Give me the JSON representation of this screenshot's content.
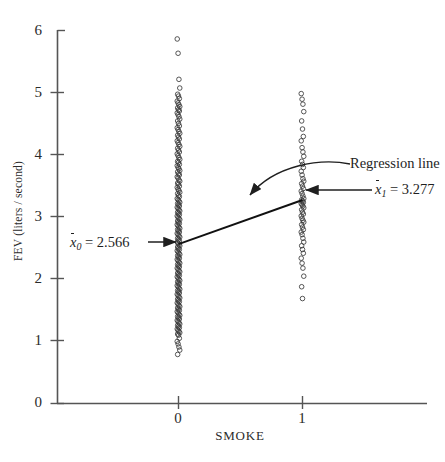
{
  "chart_data": {
    "type": "scatter",
    "title": "",
    "xlabel": "SMOKE",
    "ylabel": "FEV (liters / second)",
    "xlim": [
      -0.43,
      1.0
    ],
    "ylim": [
      0,
      6
    ],
    "xticks": [
      "0",
      "1"
    ],
    "xtick_values": [
      0,
      1
    ],
    "yticks": [
      "0",
      "1",
      "2",
      "3",
      "4",
      "5",
      "6"
    ],
    "ytick_values": [
      0,
      1,
      2,
      3,
      4,
      5,
      6
    ],
    "grid": false,
    "legend": "none",
    "series": [
      {
        "name": "SMOKE = 0",
        "x": 0,
        "n_visible": 180,
        "y_min": 0.79,
        "y_max": 5.87,
        "mean": 2.566,
        "values": [
          5.87,
          5.64,
          5.22,
          5.08,
          4.98,
          4.95,
          4.91,
          4.87,
          4.84,
          4.81,
          4.78,
          4.76,
          4.73,
          4.71,
          4.68,
          4.65,
          4.62,
          4.58,
          4.55,
          4.51,
          4.47,
          4.44,
          4.41,
          4.38,
          4.35,
          4.32,
          4.29,
          4.26,
          4.23,
          4.2,
          4.17,
          4.14,
          4.11,
          4.08,
          4.05,
          4.02,
          3.99,
          3.96,
          3.93,
          3.9,
          3.88,
          3.85,
          3.83,
          3.8,
          3.78,
          3.75,
          3.73,
          3.7,
          3.68,
          3.65,
          3.63,
          3.6,
          3.58,
          3.55,
          3.53,
          3.5,
          3.48,
          3.45,
          3.43,
          3.4,
          3.38,
          3.35,
          3.33,
          3.3,
          3.28,
          3.26,
          3.24,
          3.22,
          3.2,
          3.18,
          3.16,
          3.14,
          3.12,
          3.1,
          3.08,
          3.06,
          3.04,
          3.02,
          3.0,
          2.98,
          2.96,
          2.94,
          2.92,
          2.9,
          2.88,
          2.86,
          2.84,
          2.82,
          2.8,
          2.78,
          2.76,
          2.74,
          2.72,
          2.7,
          2.68,
          2.66,
          2.64,
          2.62,
          2.6,
          2.58,
          2.56,
          2.54,
          2.52,
          2.5,
          2.48,
          2.46,
          2.44,
          2.42,
          2.4,
          2.38,
          2.36,
          2.34,
          2.32,
          2.3,
          2.28,
          2.26,
          2.24,
          2.22,
          2.2,
          2.18,
          2.16,
          2.14,
          2.12,
          2.1,
          2.08,
          2.06,
          2.04,
          2.02,
          2.0,
          1.98,
          1.96,
          1.94,
          1.92,
          1.9,
          1.88,
          1.86,
          1.84,
          1.82,
          1.8,
          1.78,
          1.76,
          1.74,
          1.72,
          1.7,
          1.68,
          1.66,
          1.64,
          1.62,
          1.6,
          1.58,
          1.56,
          1.54,
          1.52,
          1.5,
          1.48,
          1.46,
          1.44,
          1.42,
          1.4,
          1.38,
          1.36,
          1.34,
          1.32,
          1.3,
          1.28,
          1.26,
          1.24,
          1.22,
          1.2,
          1.18,
          1.16,
          1.14,
          1.12,
          1.1,
          1.05,
          1.0,
          0.96,
          0.91,
          0.86,
          0.79
        ]
      },
      {
        "name": "SMOKE = 1",
        "x": 1,
        "n_visible": 55,
        "y_min": 1.69,
        "y_max": 4.99,
        "mean": 3.277,
        "values": [
          4.99,
          4.9,
          4.82,
          4.7,
          4.55,
          4.42,
          4.3,
          4.23,
          4.12,
          4.05,
          3.98,
          3.9,
          3.85,
          3.8,
          3.74,
          3.68,
          3.62,
          3.58,
          3.54,
          3.5,
          3.46,
          3.42,
          3.38,
          3.34,
          3.3,
          3.28,
          3.26,
          3.24,
          3.22,
          3.2,
          3.18,
          3.15,
          3.12,
          3.08,
          3.05,
          3.02,
          2.98,
          2.95,
          2.92,
          2.88,
          2.84,
          2.8,
          2.76,
          2.72,
          2.66,
          2.6,
          2.54,
          2.48,
          2.42,
          2.34,
          2.26,
          2.18,
          2.05,
          1.88,
          1.69
        ]
      }
    ],
    "regression_line": {
      "label": "Regression line",
      "x0": 0,
      "y0": 2.566,
      "x1": 1,
      "y1": 3.277,
      "slope": 0.711,
      "intercept": 2.566
    },
    "annotations": [
      {
        "name": "mean-smoke-0",
        "var": "x",
        "subscript": "0",
        "equals": "= 2.566",
        "value": 2.566,
        "arrow": "right"
      },
      {
        "name": "mean-smoke-1",
        "var": "x",
        "subscript": "1",
        "equals": "= 3.277",
        "value": 3.277,
        "arrow": "left"
      },
      {
        "name": "regression-line-callout",
        "text": "Regression line",
        "arrow": "curved-left"
      }
    ]
  },
  "axis": {
    "y_tick_labels": [
      "6",
      "5",
      "4",
      "3",
      "2",
      "1",
      "0"
    ],
    "x_tick_labels": [
      "0",
      "1"
    ],
    "y_title": "FEV (liters / second)",
    "x_title": "SMOKE"
  },
  "colors": {
    "axis": "#555555",
    "point": "#3a3a3a",
    "line": "#111111",
    "text": "#1f1f1f",
    "background": "#ffffff"
  }
}
